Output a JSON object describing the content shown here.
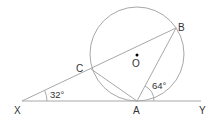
{
  "diagram": {
    "type": "circle-tangent-geometry",
    "points": {
      "X": {
        "label": "X",
        "x": 22,
        "y": 101
      },
      "A": {
        "label": "A",
        "x": 137,
        "y": 101
      },
      "Y": {
        "label": "Y",
        "x": 201,
        "y": 101
      },
      "B": {
        "label": "B",
        "x": 176,
        "y": 28
      },
      "C": {
        "label": "C",
        "x": 91,
        "y": 69
      },
      "O": {
        "label": "O",
        "x": 137,
        "y": 54
      }
    },
    "circle": {
      "center": "O",
      "cx": 137,
      "cy": 54,
      "r": 47
    },
    "segments": [
      {
        "from": "X",
        "to": "Y",
        "name": "tangent-line-xy"
      },
      {
        "from": "X",
        "to": "B",
        "name": "secant-xb"
      },
      {
        "from": "A",
        "to": "B",
        "name": "chord-ab"
      },
      {
        "from": "C",
        "to": "A",
        "name": "chord-ca"
      }
    ],
    "angles": [
      {
        "vertex": "X",
        "label": "32°",
        "value": 32
      },
      {
        "vertex": "A",
        "label": "64°",
        "value": 64
      }
    ],
    "colors": {
      "line": "#a0a0a0",
      "text": "#333333",
      "center_dot": "#000000"
    }
  }
}
